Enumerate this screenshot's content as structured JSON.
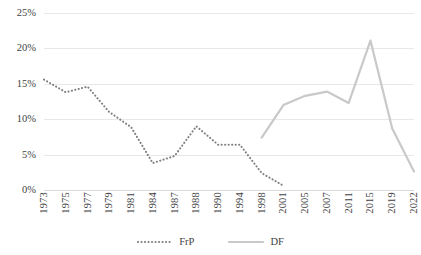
{
  "chart_data": {
    "type": "line",
    "title": "",
    "xlabel": "",
    "ylabel": "",
    "grid": true,
    "legend_position": "bottom",
    "ylim": [
      0,
      25
    ],
    "y_ticks": [
      "0%",
      "5%",
      "10%",
      "15%",
      "20%",
      "25%"
    ],
    "y_tick_values": [
      0,
      5,
      10,
      15,
      20,
      25
    ],
    "categories": [
      "1973",
      "1975",
      "1977",
      "1979",
      "1981",
      "1984",
      "1987",
      "1988",
      "1990",
      "1994",
      "1998",
      "2001",
      "2005",
      "2007",
      "2011",
      "2015",
      "2019",
      "2022"
    ],
    "series": [
      {
        "name": "FrP",
        "style": "dotted",
        "color": "#808080",
        "values": [
          15.6,
          13.8,
          14.6,
          11.0,
          8.9,
          3.8,
          4.8,
          9.0,
          6.4,
          6.4,
          2.4,
          0.6,
          null,
          null,
          null,
          null,
          null,
          null
        ]
      },
      {
        "name": "DF",
        "style": "solid",
        "color": "#c9c9c9",
        "values": [
          null,
          null,
          null,
          null,
          null,
          null,
          null,
          null,
          null,
          null,
          7.4,
          12.0,
          13.3,
          13.9,
          12.3,
          21.1,
          8.7,
          2.6
        ]
      }
    ]
  },
  "legend": {
    "items": [
      {
        "label": "FrP",
        "style": "dotted",
        "color": "#808080"
      },
      {
        "label": "DF",
        "style": "solid",
        "color": "#c9c9c9"
      }
    ]
  }
}
